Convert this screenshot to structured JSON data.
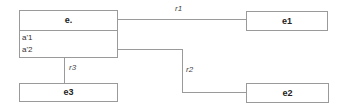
{
  "diagram": {
    "entities": [
      {
        "id": "e",
        "title": "e.",
        "attributes": [
          "a'1",
          "a'2"
        ]
      },
      {
        "id": "e1",
        "title": "e1",
        "attributes": []
      },
      {
        "id": "e2",
        "title": "e2",
        "attributes": []
      },
      {
        "id": "e3",
        "title": "e3",
        "attributes": []
      }
    ],
    "relations": [
      {
        "label": "r1",
        "from": "e",
        "to": "e1"
      },
      {
        "label": "r2",
        "from": "e",
        "to": "e2"
      },
      {
        "label": "r3",
        "from": "e",
        "to": "e3"
      }
    ],
    "colors": {
      "line": "#9a9a9a",
      "border": "#9a9a9a",
      "text": "#222222"
    }
  }
}
